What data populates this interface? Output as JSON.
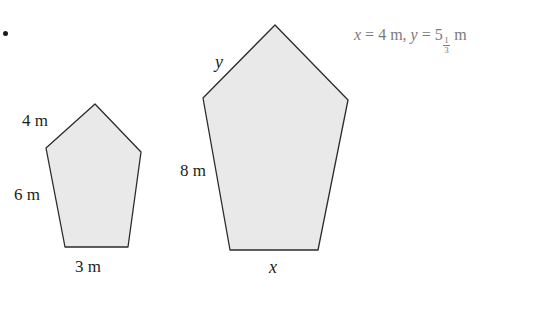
{
  "figure": {
    "bullet": "•",
    "fill_color": "#e9e9e9",
    "stroke_color": "#2b2b2b",
    "small_pentagon": {
      "name": "small-pentagon",
      "labels": {
        "upper_left_side": "4 m",
        "left_side": "6 m",
        "bottom_side": "3 m"
      }
    },
    "large_pentagon": {
      "name": "large-pentagon",
      "labels": {
        "upper_left_side": "y",
        "left_side": "8 m",
        "bottom_side": "x"
      }
    }
  },
  "answer": {
    "var_x": "x",
    "eq1": " = 4 m, ",
    "var_y": "y",
    "eq2": " = 5",
    "fraction_numerator": "1",
    "fraction_denominator": "3",
    "unit": " m",
    "full_text": "x = 4 m, y = 5 1/3 m",
    "color": "#7a7a7a"
  }
}
